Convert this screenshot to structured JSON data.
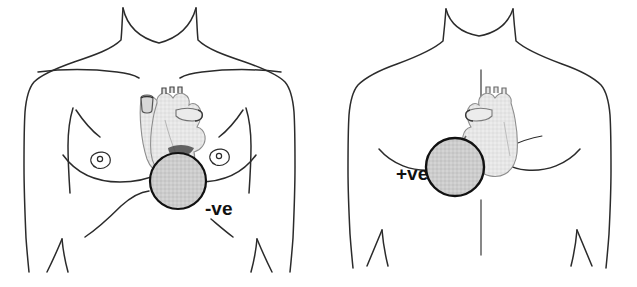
{
  "figure": {
    "background_color": "#ffffff",
    "width": 637,
    "height": 287
  },
  "palette": {
    "outline": "#2b2b2b",
    "body_fill": "#ffffff",
    "heart_fill": "#e4e4e4",
    "heart_outline": "#8d8d8d",
    "heart_shadow": "#c9c9c9",
    "electrode_fill": "#cccccc",
    "electrode_outline": "#111111",
    "midline": "#555555",
    "label_color": "#111111"
  },
  "panels": [
    {
      "id": "anterior",
      "name": "anterior-view",
      "view": "front",
      "electrode": {
        "label": "-ve",
        "polarity": "negative",
        "name": "negative-electrode",
        "center_x": 178,
        "center_y": 181,
        "radius": 28,
        "fill": "#cccccc",
        "outline": "#111111"
      },
      "label": {
        "text": "-ve",
        "x": 205,
        "y": 215
      },
      "heart": {
        "name": "heart-anterior",
        "fill": "#e4e4e4",
        "outline": "#8d8d8d"
      },
      "anatomy_parts": [
        "neck",
        "left-shoulder",
        "right-shoulder",
        "left-clavicle",
        "right-clavicle",
        "left-breast",
        "right-breast",
        "left-nipple",
        "right-nipple",
        "left-arm",
        "right-arm",
        "ribcage-margin"
      ]
    },
    {
      "id": "posterior",
      "name": "posterior-view",
      "view": "back",
      "electrode": {
        "label": "+ve",
        "polarity": "positive",
        "name": "positive-electrode",
        "center_x": 455,
        "center_y": 167,
        "radius": 29,
        "fill": "#cccccc",
        "outline": "#111111"
      },
      "label": {
        "text": "+ve",
        "x": 396,
        "y": 180
      },
      "heart": {
        "name": "heart-posterior",
        "fill": "#e4e4e4",
        "outline": "#8d8d8d"
      },
      "spine": {
        "name": "spine-midline",
        "x": 481,
        "y_top": 70,
        "y_bottom": 255,
        "color": "#555555"
      },
      "anatomy_parts": [
        "neck",
        "left-shoulder",
        "right-shoulder",
        "left-scapula",
        "right-scapula",
        "left-arm",
        "right-arm",
        "spine-midline",
        "latissimus-fold-left",
        "latissimus-fold-right"
      ]
    }
  ]
}
